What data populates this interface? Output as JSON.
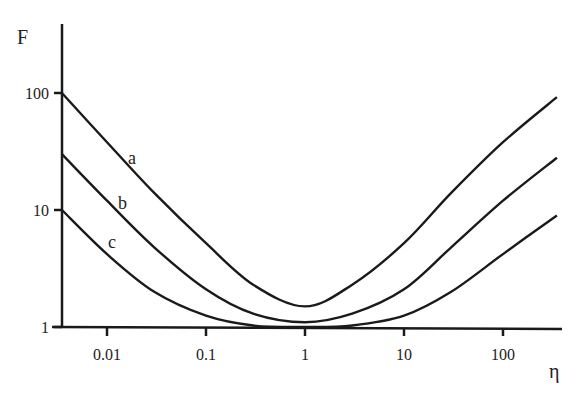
{
  "chart_data": {
    "type": "line",
    "title": "",
    "xlabel": "η",
    "ylabel": "F",
    "xscale": "log",
    "yscale": "log",
    "xlim": [
      0.0035,
      350
    ],
    "ylim": [
      1,
      300
    ],
    "x_ticks": [
      "0.01",
      "0.1",
      "1",
      "10",
      "100"
    ],
    "y_ticks": [
      "1",
      "10",
      "100"
    ],
    "grid": false,
    "legend": "inline labels a, b, c",
    "x": [
      0.0035,
      0.01,
      0.03,
      0.1,
      0.3,
      1,
      3,
      10,
      30,
      100,
      350
    ],
    "series": [
      {
        "name": "a",
        "values": [
          100,
          38,
          14,
          5.2,
          2.3,
          1.5,
          2.3,
          5.2,
          14,
          38,
          92
        ]
      },
      {
        "name": "b",
        "values": [
          30,
          12,
          4.8,
          2.1,
          1.3,
          1.1,
          1.3,
          2.1,
          4.8,
          12,
          28
        ]
      },
      {
        "name": "c",
        "values": [
          10,
          4.2,
          2.0,
          1.25,
          1.03,
          1.0,
          1.03,
          1.25,
          2.0,
          4.2,
          9
        ]
      }
    ]
  },
  "labels": {
    "y_axis": "F",
    "x_axis": "η",
    "curve_a": "a",
    "curve_b": "b",
    "curve_c": "c"
  }
}
